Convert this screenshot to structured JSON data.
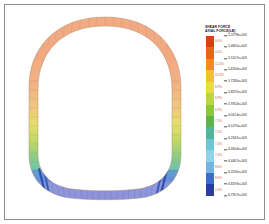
{
  "figure": {
    "name": "axial-force-contour-plot",
    "background_color": "#ffffff",
    "frame_color": "#8d8d8d"
  },
  "legend": {
    "title": "SHEAR FORCE",
    "subtitle": "AXIAL FORCE(LB)",
    "title_color": "#1b1b1b",
    "percent_color": "#c2603a",
    "bands": [
      {
        "color": "#d93f10",
        "percent": "0.0%"
      },
      {
        "color": "#e8631c",
        "percent": "0.0%"
      },
      {
        "color": "#ef8c22",
        "percent": "12.0%"
      },
      {
        "color": "#f2c22a",
        "percent": "10.3%"
      },
      {
        "color": "#e8e03a",
        "percent": "6.9%"
      },
      {
        "color": "#b9d447",
        "percent": "6.9%"
      },
      {
        "color": "#8cc63f",
        "percent": "6.9%"
      },
      {
        "color": "#5fb34c",
        "percent": "7.5%"
      },
      {
        "color": "#4fb59b",
        "percent": "7.5%"
      },
      {
        "color": "#6cc6d4",
        "percent": "7.4%"
      },
      {
        "color": "#8fd3ea",
        "percent": "7.4%"
      },
      {
        "color": "#74b4e0",
        "percent": "8.6%"
      },
      {
        "color": "#3a6fc4",
        "percent": "8.6%"
      },
      {
        "color": "#28409c",
        "percent": "2.0%"
      }
    ],
    "values": [
      "-5.1978e+003",
      "-5.4661e+003",
      "-5.5107e+003",
      "-5.6160e+003",
      "-5.7280e+003",
      "-5.8291e+003",
      "-5.9354e+003",
      "-6.0414e+003",
      "-6.1470e+003",
      "-6.2342e+003",
      "-6.3404e+003",
      "-6.4467e+003",
      "-6.5530e+003",
      "-6.6593e+003",
      "-6.7357e+003"
    ]
  },
  "chart_data": {
    "type": "heatmap",
    "subtitle": "Finite element axial force contour on a horseshoe tunnel lining ring",
    "xlabel": "",
    "ylabel": "",
    "colormap": "jet-reversed (red high, blue low)",
    "legend_position": "right",
    "grid": false,
    "units": "LB",
    "value_min": "-6.7357e+003",
    "value_max": "-5.1978e+003",
    "geometry": {
      "shape": "horseshoe-ring",
      "description": "Closed curved ring: rounded crown on top, near-vertical sidewalls, flattened invert at bottom",
      "mesh_segments": 96,
      "ring_thickness_px": 9
    },
    "contour_stops": [
      {
        "position": 0.0,
        "label": "crown-top",
        "color": "#f2ac84",
        "value": -5350
      },
      {
        "position": 0.12,
        "label": "upper-shoulder",
        "color": "#f2ac84",
        "value": -5380
      },
      {
        "position": 0.28,
        "label": "springline-upper",
        "color": "#f1b07f",
        "value": -5450
      },
      {
        "position": 0.42,
        "label": "springline",
        "color": "#e8d36b",
        "value": -5760
      },
      {
        "position": 0.55,
        "label": "lower-haunch",
        "color": "#a8d178",
        "value": -6050
      },
      {
        "position": 0.68,
        "label": "haunch-knee",
        "color": "#6ec6b4",
        "value": -6280
      },
      {
        "position": 0.8,
        "label": "invert-corner",
        "color": "#4f7fd0",
        "value": -6550
      },
      {
        "position": 1.0,
        "label": "invert-center",
        "color": "#8e93d8",
        "value": -6420
      }
    ],
    "series": [
      {
        "name": "Axial force around ring (LB)",
        "x": [
          0,
          30,
          60,
          90,
          120,
          150,
          180,
          210,
          240,
          270,
          300,
          330,
          360
        ],
        "values": [
          -5350,
          -5400,
          -5500,
          -5760,
          -6050,
          -6400,
          -6420,
          -6400,
          -6050,
          -5760,
          -5500,
          -5400,
          -5350
        ]
      }
    ]
  }
}
